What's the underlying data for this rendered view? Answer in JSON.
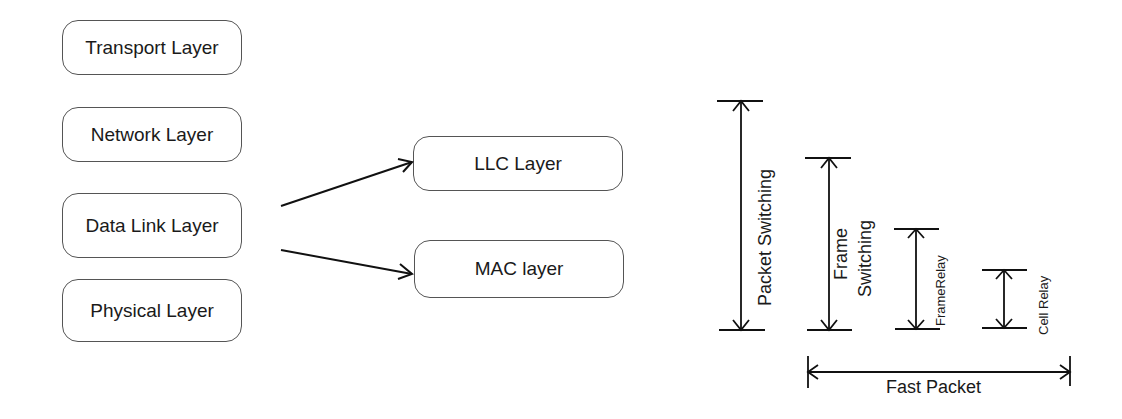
{
  "layers": {
    "left_stack": [
      {
        "label": "Transport Layer"
      },
      {
        "label": "Network Layer"
      },
      {
        "label": "Data Link Layer"
      },
      {
        "label": "Physical Layer"
      }
    ],
    "sublayers": [
      {
        "label": "LLC Layer"
      },
      {
        "label": "MAC layer"
      }
    ]
  },
  "switching": {
    "packet_switching": "Packet Switching",
    "frame_switching_line1": "Frame",
    "frame_switching_line2": "Switching",
    "frame_relay": "FrameRelay",
    "cell_relay": "Cell Relay",
    "fast_packet": "Fast Packet"
  },
  "colors": {
    "stroke": "#111111",
    "box_border": "#555555"
  }
}
